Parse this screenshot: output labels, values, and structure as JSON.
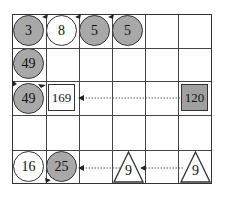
{
  "grid": {
    "columns": 6,
    "rows": 5
  },
  "colors": {
    "gray_fill": "#a8a8a8",
    "line": "#333333",
    "background": "#ffffff"
  },
  "row1": {
    "c1": "3",
    "c2": "8",
    "c3": "5",
    "c4": "5"
  },
  "row2": {
    "c1": "49"
  },
  "row3": {
    "c1": "49",
    "c2": "169",
    "c6": "120"
  },
  "row5": {
    "c1": "16",
    "c2": "25",
    "c4": "9",
    "c6": "9"
  }
}
